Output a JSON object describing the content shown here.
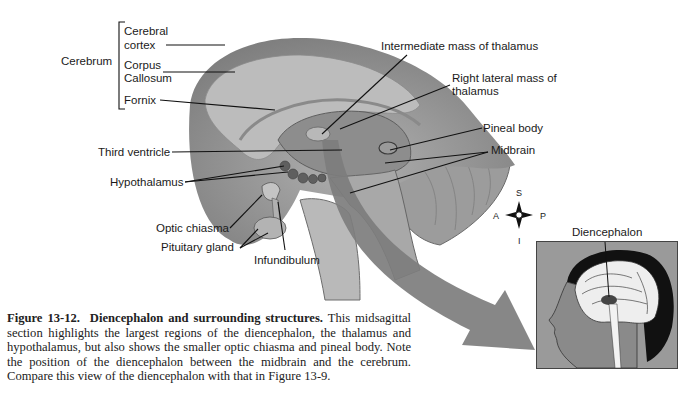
{
  "figure": {
    "number_label": "Figure 13-12.",
    "title": "Diencephalon and surrounding structures.",
    "caption_body": "This midsagittal section highlights the largest regions of the diencephalon, the thalamus and hypothalamus, but also shows the smaller optic chiasma and pineal body. Note the position of the diencephalon between the midbrain and the cerebrum. Compare this view of the diencephalon with that in Figure 13-9."
  },
  "labels": {
    "cerebrum": "Cerebrum",
    "cerebral_cortex_1": "Cerebral",
    "cerebral_cortex_2": "cortex",
    "corpus_callosum_1": "Corpus",
    "corpus_callosum_2": "Callosum",
    "fornix": "Fornix",
    "intermediate_mass": "Intermediate mass of thalamus",
    "right_lateral_mass_1": "Right lateral mass of",
    "right_lateral_mass_2": "thalamus",
    "pineal_body": "Pineal body",
    "midbrain": "Midbrain",
    "third_ventricle": "Third ventricle",
    "hypothalamus": "Hypothalamus",
    "optic_chiasma": "Optic chiasma",
    "pituitary_gland": "Pituitary gland",
    "infundibulum": "Infundibulum",
    "diencephalon_inset": "Diencephalon"
  },
  "compass": {
    "superior": "S",
    "inferior": "I",
    "anterior": "A",
    "posterior": "P"
  },
  "colors": {
    "brain_outer": "#8f8f8f",
    "brain_inner": "#b5b5b5",
    "arrow": "#7d7d7d",
    "inset_bg": "#9a9a9a"
  }
}
